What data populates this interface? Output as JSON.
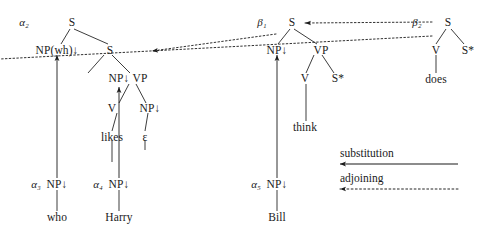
{
  "diagram": {
    "colors": {
      "ink": "#1a1a1a",
      "background": "#ffffff"
    },
    "legend": {
      "substitution_label": "substitution",
      "adjoining_label": "adjoining"
    },
    "tree_labels": {
      "alpha2": "α₂",
      "alpha3": "α₃",
      "alpha4": "α₄",
      "alpha5": "α₅",
      "beta1": "β₁",
      "beta2": "β₂"
    },
    "nodes": {
      "a2_S_root": "S",
      "a2_NPwh": "NP(wh)↓",
      "a2_S_lower": "S",
      "a2_NP_sub": "NP↓",
      "a2_VP": "VP",
      "a2_V": "V",
      "a2_NP_obj": "NP↓",
      "a2_likes": "likes",
      "a2_epsilon": "ε",
      "b1_S": "S",
      "b1_NP": "NP↓",
      "b1_VP": "VP",
      "b1_V": "V",
      "b1_foot": "S*",
      "b1_think": "think",
      "b2_S": "S",
      "b2_V": "V",
      "b2_foot": "S*",
      "b2_does": "does",
      "a3_NP": "NP↓",
      "a3_who": "who",
      "a4_NP": "NP↓",
      "a4_harry": "Harry",
      "a5_NP": "NP↓",
      "a5_bill": "Bill"
    }
  }
}
